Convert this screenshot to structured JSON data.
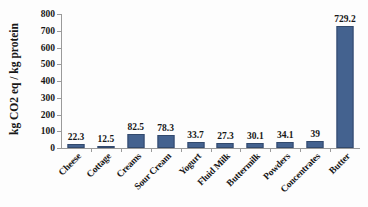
{
  "chart": {
    "type": "bar",
    "title": "",
    "ylabel": "kg CO2 eq / kg protein",
    "xlabel": ""
  },
  "chart_data": {
    "type": "bar",
    "title": "",
    "xlabel": "",
    "ylabel": "kg CO2 eq / kg protein",
    "ylim": [
      0,
      800
    ],
    "ytick_step": 100,
    "yticks": [
      "0",
      "100",
      "200",
      "300",
      "400",
      "500",
      "600",
      "700",
      "800"
    ],
    "grid": false,
    "legend": null,
    "bar_color": "#44628F",
    "categories": [
      "Cheese",
      "Cottage",
      "Creams",
      "Sour Cream",
      "Yogurt",
      "Fluid Milk",
      "Buttermilk",
      "Powders",
      "Concentrates",
      "Butter"
    ],
    "values": [
      22.3,
      12.5,
      82.5,
      78.3,
      33.7,
      27.3,
      30.1,
      34.1,
      39,
      729.2
    ],
    "value_labels": [
      "22.3",
      "12.5",
      "82.5",
      "78.3",
      "33.7",
      "27.3",
      "30.1",
      "34.1",
      "39",
      "729.2"
    ]
  }
}
